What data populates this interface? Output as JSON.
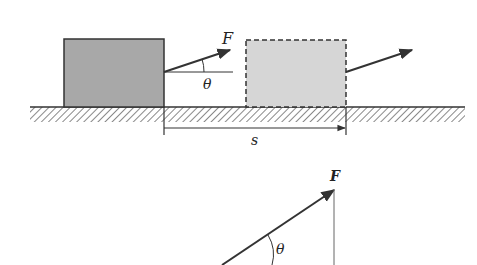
{
  "diagram": {
    "labels": {
      "force_top": "F",
      "angle_top": "θ",
      "displacement": "s",
      "force_bottom": "F",
      "angle_bottom": "θ"
    },
    "colors": {
      "block_initial": "#a8a8a8",
      "block_final": "#d6d6d6",
      "stroke": "#333333"
    }
  }
}
